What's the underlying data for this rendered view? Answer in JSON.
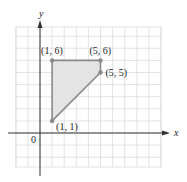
{
  "chart_data": {
    "type": "scatter",
    "title": "",
    "xlabel": "x",
    "ylabel": "y",
    "origin_label": "0",
    "xlim": [
      -2,
      10
    ],
    "ylim": [
      -3,
      8
    ],
    "grid": true,
    "polygon": {
      "filled": true,
      "vertices": [
        {
          "x": 1,
          "y": 1,
          "label": "(1, 1)"
        },
        {
          "x": 1,
          "y": 6,
          "label": "(1, 6)"
        },
        {
          "x": 5,
          "y": 6,
          "label": "(5, 6)"
        },
        {
          "x": 5,
          "y": 5,
          "label": "(5, 5)"
        }
      ]
    },
    "points": [
      {
        "x": 1,
        "y": 6,
        "label": "(1, 6)"
      },
      {
        "x": 5,
        "y": 6,
        "label": "(5, 6)"
      },
      {
        "x": 5,
        "y": 5,
        "label": "(5, 5)"
      },
      {
        "x": 1,
        "y": 1,
        "label": "(1, 1)"
      }
    ]
  },
  "colors": {
    "grid": "#dcdcdc",
    "axis": "#333333",
    "polygon_fill": "#e4e4e4",
    "polygon_edge": "#8a8a8a",
    "point": "#8a8a8a"
  }
}
